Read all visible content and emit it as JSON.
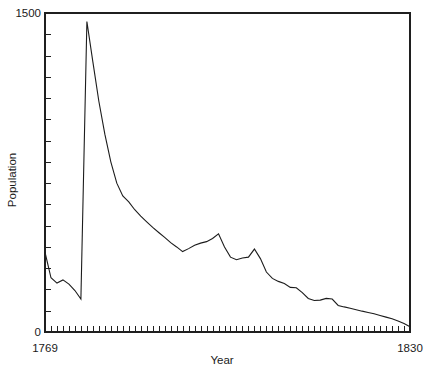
{
  "chart_data": {
    "type": "line",
    "title": "",
    "xlabel": "Year",
    "ylabel": "Population",
    "xlim": [
      1769,
      1830
    ],
    "ylim": [
      0,
      1500
    ],
    "grid": false,
    "legend": null,
    "x_tick_labels": [
      "1769",
      "1830"
    ],
    "y_tick_labels": [
      "0",
      "1500"
    ],
    "x_minor_tick_step": 1,
    "y_minor_tick_step": 100,
    "series": [
      {
        "name": "Population",
        "x": [
          1769,
          1770,
          1771,
          1772,
          1773,
          1774,
          1775,
          1776,
          1777,
          1778,
          1779,
          1780,
          1781,
          1782,
          1783,
          1784,
          1785,
          1786,
          1787,
          1788,
          1789,
          1790,
          1791,
          1792,
          1793,
          1794,
          1795,
          1796,
          1797,
          1798,
          1799,
          1800,
          1801,
          1802,
          1803,
          1804,
          1805,
          1806,
          1807,
          1808,
          1809,
          1810,
          1811,
          1812,
          1813,
          1814,
          1815,
          1816,
          1817,
          1818,
          1819,
          1820,
          1821,
          1822,
          1823,
          1824,
          1825,
          1826,
          1827,
          1828,
          1829,
          1830
        ],
        "values": [
          375,
          255,
          230,
          245,
          225,
          195,
          155,
          1460,
          1270,
          1085,
          930,
          800,
          700,
          640,
          612,
          575,
          545,
          518,
          492,
          468,
          445,
          420,
          400,
          378,
          392,
          408,
          418,
          425,
          440,
          462,
          400,
          352,
          340,
          348,
          352,
          390,
          345,
          282,
          252,
          238,
          228,
          210,
          208,
          185,
          158,
          148,
          150,
          158,
          155,
          125,
          118,
          112,
          105,
          98,
          92,
          86,
          78,
          70,
          62,
          52,
          40,
          25
        ]
      }
    ]
  },
  "layout": {
    "plot_left": 45,
    "plot_right": 410,
    "plot_top": 13,
    "plot_bottom": 332
  }
}
